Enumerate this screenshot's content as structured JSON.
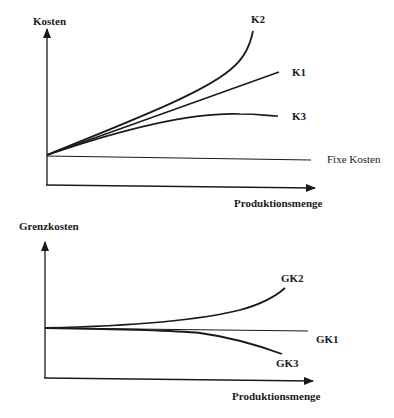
{
  "top_chart": {
    "y_axis_label": "Kosten",
    "x_axis_label": "Produktionsmenge",
    "curves": {
      "k2": "K2",
      "k1": "K1",
      "k3": "K3",
      "fixed": "Fixe Kosten"
    }
  },
  "bottom_chart": {
    "y_axis_label": "Grenzkosten",
    "x_axis_label": "Produktionsmenge",
    "curves": {
      "gk2": "GK2",
      "gk1": "GK1",
      "gk3": "GK3"
    }
  },
  "colors": {
    "ink": "#1a1a1a",
    "background": "#ffffff"
  }
}
